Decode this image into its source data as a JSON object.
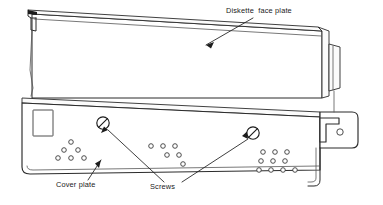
{
  "diagram": {
    "type": "line-drawing",
    "background_color": "#ffffff",
    "line_color": "#2b2b2b",
    "labels": {
      "face_plate": "Diskette  face plate",
      "cover_plate": "Cover plate",
      "screws": "Screws"
    },
    "parts": [
      {
        "name": "diskette-face-plate",
        "label": "Diskette  face plate",
        "description": "Long slanted rectangular panel across the upper portion with a thin top edge band, a hooked tab at the left end and a raised tab at the right end"
      },
      {
        "name": "cover-plate",
        "label": "Cover plate",
        "description": "Lower slanted panel with a rectangular cutout at the left and three clusters of ventilation holes"
      },
      {
        "name": "screws",
        "label": "Screws",
        "count": 2,
        "description": "Two slotted round-head screws on the cover plate, drawn as circles with a diagonal slot"
      },
      {
        "name": "right-bracket",
        "label": "",
        "description": "Notched mounting bracket at lower right with a single round hole"
      }
    ],
    "hole_clusters": [
      {
        "name": "left-hole-cluster",
        "pattern": "triangular",
        "rows": [
          1,
          2,
          3
        ],
        "count": 6
      },
      {
        "name": "middle-hole-cluster",
        "pattern": "descending-diagonal",
        "rows": [
          3,
          2,
          1
        ],
        "count": 6
      },
      {
        "name": "right-hole-cluster",
        "pattern": "grid",
        "rows": [
          3,
          3,
          4
        ],
        "count": 10
      }
    ],
    "leaders": [
      {
        "name": "leader-face-plate",
        "from": "Diskette  face plate",
        "to": "diskette-face-plate"
      },
      {
        "name": "leader-cover-plate",
        "from": "Cover plate",
        "to": "cover-plate"
      },
      {
        "name": "leader-screw-left",
        "from": "Screws",
        "to": "screw-left"
      },
      {
        "name": "leader-screw-right",
        "from": "Screws",
        "to": "screw-right"
      }
    ]
  }
}
